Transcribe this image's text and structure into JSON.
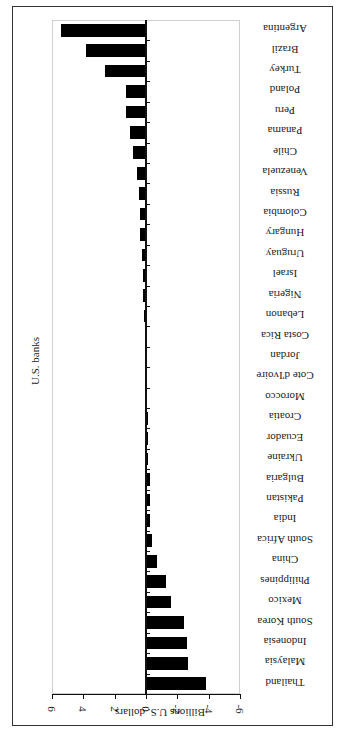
{
  "chart_data": {
    "type": "bar",
    "orientation": "vertical bars, image rotated 90 degrees (labels appear upside-down)",
    "title": "U.S. banks",
    "xlabel": "",
    "ylabel": "Billions U.S. dollars",
    "ylim": [
      -6,
      6
    ],
    "yticks": [
      6,
      4,
      2,
      0,
      -2,
      -4,
      -6
    ],
    "grid": false,
    "legend": null,
    "categories": [
      "Argentina",
      "Brazil",
      "Turkey",
      "Poland",
      "Peru",
      "Panama",
      "Chile",
      "Venezuela",
      "Russia",
      "Colombia",
      "Hungary",
      "Uruguay",
      "Israel",
      "Nigeria",
      "Lebanon",
      "Costa Rica",
      "Jordan",
      "Cote d'Ivoire",
      "Morocco",
      "Croatia",
      "Ecuador",
      "Ukraine",
      "Bulgaria",
      "Pakistan",
      "India",
      "South Africa",
      "China",
      "Philippines",
      "Mexico",
      "South Korea",
      "Indonesia",
      "Malaysia",
      "Thailand"
    ],
    "values": [
      5.4,
      3.8,
      2.6,
      1.3,
      1.3,
      1.0,
      0.8,
      0.6,
      0.45,
      0.4,
      0.4,
      0.25,
      0.2,
      0.2,
      0.1,
      0.0,
      0.0,
      0.0,
      0.0,
      -0.05,
      -0.15,
      -0.15,
      -0.25,
      -0.25,
      -0.25,
      -0.4,
      -0.7,
      -1.3,
      -1.6,
      -2.4,
      -2.6,
      -2.7,
      -3.8
    ]
  }
}
